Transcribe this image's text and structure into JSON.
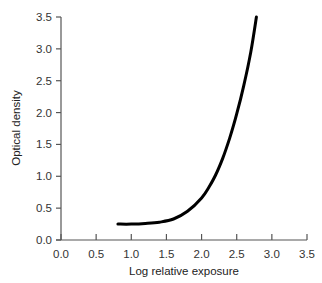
{
  "chart_data": {
    "type": "line",
    "title": "",
    "xlabel": "Log relative exposure",
    "ylabel": "Optical density",
    "xlim": [
      0,
      3.5
    ],
    "ylim": [
      0,
      3.5
    ],
    "xticks": [
      "0.0",
      "0.5",
      "1.0",
      "1.5",
      "2.0",
      "2.5",
      "3.0",
      "3.5"
    ],
    "yticks": [
      "0.0",
      "0.5",
      "1.0",
      "1.5",
      "2.0",
      "2.5",
      "3.0",
      "3.5"
    ],
    "grid": false,
    "legend": null,
    "series": [
      {
        "name": "Characteristic curve",
        "color": "#000000",
        "x": [
          0.81,
          1.0,
          1.2,
          1.4,
          1.6,
          1.8,
          2.0,
          2.1,
          2.2,
          2.3,
          2.4,
          2.5,
          2.6,
          2.7,
          2.78
        ],
        "y": [
          0.25,
          0.25,
          0.26,
          0.28,
          0.33,
          0.45,
          0.66,
          0.82,
          1.02,
          1.28,
          1.6,
          1.98,
          2.42,
          2.95,
          3.5
        ]
      }
    ]
  },
  "plot": {
    "x_axis_label": "Log relative exposure",
    "y_axis_label": "Optical density"
  }
}
